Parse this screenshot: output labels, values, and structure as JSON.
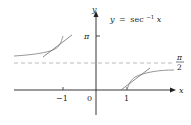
{
  "equation": {
    "lhs": "y",
    "eq": "=",
    "fn": "sec",
    "sup": "−1",
    "arg": "x"
  },
  "axes": {
    "x_label": "x",
    "y_label": "y",
    "origin_label": "0",
    "x_ticks": [
      "−1",
      "1"
    ],
    "y_ticks": [
      "π"
    ],
    "asymptote_label_num": "π",
    "asymptote_label_den": "2"
  },
  "colors": {
    "axis": "#231f20",
    "curve": "#8c8c8c",
    "tangent": "#6d6e71",
    "asymptote": "#a7a9ac"
  }
}
